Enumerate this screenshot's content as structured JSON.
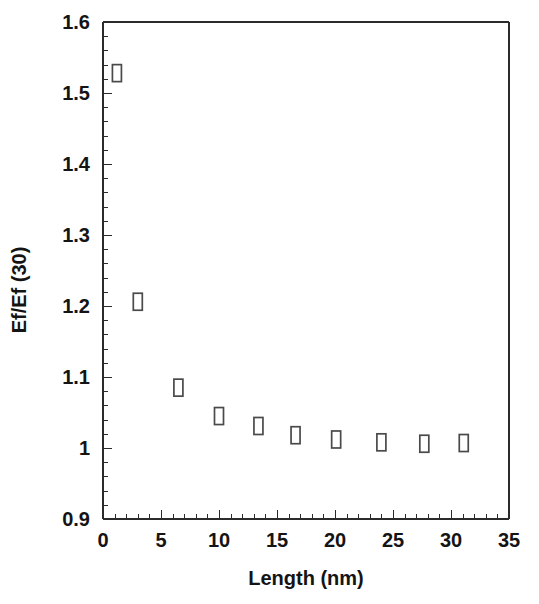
{
  "chart_data": {
    "type": "scatter",
    "title": "",
    "xlabel": "Length (nm)",
    "ylabel": "Ef/Ef (30)",
    "xlim": [
      0,
      35
    ],
    "ylim": [
      0.9,
      1.6
    ],
    "x_major_ticks": [
      0,
      5,
      10,
      15,
      20,
      25,
      30,
      35
    ],
    "x_tick_labels": [
      "0",
      "5",
      "10",
      "15",
      "20",
      "25",
      "30",
      "35"
    ],
    "x_minor_step": 1,
    "y_major_ticks": [
      0.9,
      1.0,
      1.1,
      1.2,
      1.3,
      1.4,
      1.5,
      1.6
    ],
    "y_tick_labels": [
      "0.9",
      "1",
      "1.1",
      "1.2",
      "1.3",
      "1.4",
      "1.5",
      "1.6"
    ],
    "y_minor_step": 0.02,
    "grid": false,
    "legend": null,
    "marker_style": "open-rectangle",
    "marker_color": "#4a4a4a",
    "frame_color": "#2b2b2b",
    "background": "#ffffff",
    "series": [
      {
        "name": "Ef/Ef (30) vs Length",
        "x": [
          1.2,
          3.0,
          6.5,
          10.0,
          13.4,
          16.6,
          20.1,
          24.0,
          27.7,
          31.1
        ],
        "values": [
          1.528,
          1.206,
          1.085,
          1.045,
          1.031,
          1.018,
          1.012,
          1.008,
          1.006,
          1.007
        ]
      }
    ]
  }
}
